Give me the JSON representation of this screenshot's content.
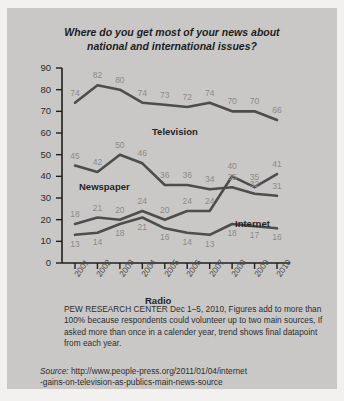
{
  "chart_data": {
    "type": "line",
    "title": "Where do you get most of your news about national and international issues?",
    "title_line1": "Where do you get most of your news about",
    "title_line2": "national and international issues?",
    "xlabel": "",
    "ylabel": "",
    "ylim": [
      0,
      90
    ],
    "ytick_labels": [
      "0",
      "10",
      "20",
      "30",
      "40",
      "50",
      "60",
      "70",
      "80",
      "90"
    ],
    "grid": false,
    "legend_position": "inline-labels",
    "categories": [
      "2001",
      "2002",
      "2003",
      "2004",
      "2005",
      "2006",
      "2007",
      "2008",
      "2009",
      "2010"
    ],
    "series": [
      {
        "name": "Television",
        "values": [
          74,
          82,
          80,
          74,
          73,
          72,
          74,
          70,
          70,
          66
        ]
      },
      {
        "name": "Newspaper",
        "values": [
          45,
          42,
          50,
          46,
          36,
          36,
          34,
          35,
          32,
          31
        ]
      },
      {
        "name": "Internet",
        "values": [
          18,
          21,
          20,
          24,
          20,
          24,
          24,
          40,
          35,
          41
        ]
      },
      {
        "name": "Radio",
        "values": [
          13,
          14,
          18,
          21,
          16,
          14,
          13,
          18,
          17,
          16
        ]
      }
    ],
    "note": "PEW RESEARCH CENTER Dec 1–5, 2010, Figures add to more than 100% because respondents could volunteer up to two main sources, If asked more than once in a calender year, trend shows final datapoint from each year.",
    "source_label": "Source:",
    "source_url": "http://www.people-press.org/2011/01/04/internet-gains-on-television-as-publics-main-news-source",
    "source_url_line1": "http://www.people-press.org/2011/01/04/internet",
    "source_url_line2": "-gains-on-television-as-publics-main-news-source",
    "colors": {
      "background": "#c9c8c6",
      "page": "#f2f1ef",
      "line": "#4d4d4d",
      "axis": "#1f1f1f",
      "value_label": "#8c8b89",
      "title_text": "#1d1d1d"
    }
  }
}
